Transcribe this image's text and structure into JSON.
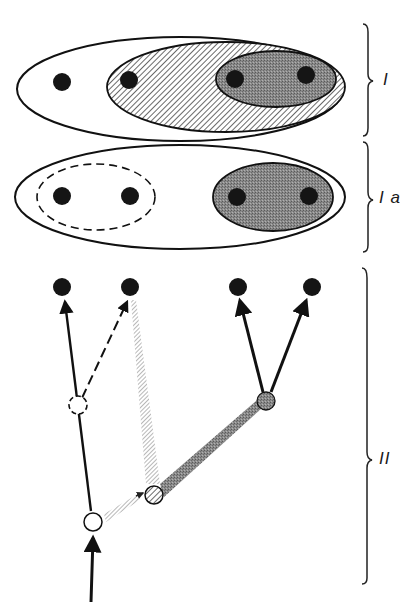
{
  "figure": {
    "type": "diagram",
    "colors": {
      "ink": "#111111",
      "terminal_dot": "#151515",
      "shaded_fill": "#7a7a7a",
      "hatch_line": "#444444",
      "light_hatch": "#9a9a9a",
      "background": "#ffffff"
    }
  },
  "panels": [
    {
      "id": "I",
      "label": "I",
      "groups": [
        {
          "name": "outer",
          "style": "solid-outline",
          "members": [
            1,
            2,
            3,
            4
          ]
        },
        {
          "name": "middle",
          "style": "hatched",
          "members": [
            2,
            3,
            4
          ]
        },
        {
          "name": "inner",
          "style": "dark-stippled",
          "members": [
            3,
            4
          ]
        }
      ]
    },
    {
      "id": "Ia",
      "label": "I a",
      "groups": [
        {
          "name": "outer",
          "style": "solid-outline",
          "members": [
            1,
            2,
            3,
            4
          ]
        },
        {
          "name": "left",
          "style": "dashed-outline",
          "members": [
            1,
            2
          ]
        },
        {
          "name": "right",
          "style": "dark-stippled",
          "members": [
            3,
            4
          ]
        }
      ]
    },
    {
      "id": "II",
      "label": "II",
      "nodes": [
        {
          "name": "root",
          "style": "open-circle"
        },
        {
          "name": "dashed-node",
          "style": "dashed-open-circle"
        },
        {
          "name": "hatched-node",
          "style": "hatched-circle"
        },
        {
          "name": "stippled-node",
          "style": "dark-stippled-circle"
        }
      ],
      "edges": [
        {
          "from": "base",
          "to": "root",
          "style": "solid-arrow"
        },
        {
          "from": "root",
          "to": "terminal-1",
          "style": "solid-arrow"
        },
        {
          "from": "dashed-node",
          "to": "terminal-2",
          "style": "dashed-arrow"
        },
        {
          "from": "root",
          "to": "hatched-node",
          "style": "light-hatched-arrow"
        },
        {
          "from": "hatched-node",
          "to": "terminal-2",
          "style": "light-hatched-arrow"
        },
        {
          "from": "hatched-node",
          "to": "stippled-node",
          "style": "dark-hatched-arrow"
        },
        {
          "from": "stippled-node",
          "to": "terminal-3",
          "style": "solid-arrow"
        },
        {
          "from": "stippled-node",
          "to": "terminal-4",
          "style": "solid-arrow"
        }
      ]
    }
  ],
  "labels": {
    "panel_I": "I",
    "panel_Ia": "I a",
    "panel_II": "II"
  }
}
